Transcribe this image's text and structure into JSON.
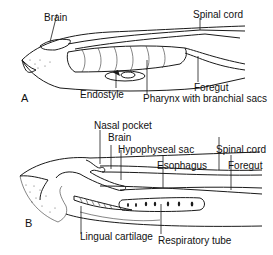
{
  "figure": {
    "panels": [
      {
        "id": "A",
        "label": "A",
        "annotations": {
          "brain": "Brain",
          "spinal_cord": "Spinal cord",
          "foregut": "Foregut",
          "endostyle": "Endostyle",
          "pharynx": "Pharynx with branchial sacs"
        }
      },
      {
        "id": "B",
        "label": "B",
        "annotations": {
          "nasal_pocket": "Nasal pocket",
          "brain": "Brain",
          "hypophyseal_sac": "Hypophyseal sac",
          "spinal_cord": "Spinal cord",
          "esophagus": "Esophagus",
          "foregut": "Foregut",
          "lingual_cartilage": "Lingual cartilage",
          "respiratory_tube": "Respiratory tube"
        }
      }
    ],
    "colors": {
      "ink": "#1a1a1a",
      "background": "#ffffff"
    }
  }
}
